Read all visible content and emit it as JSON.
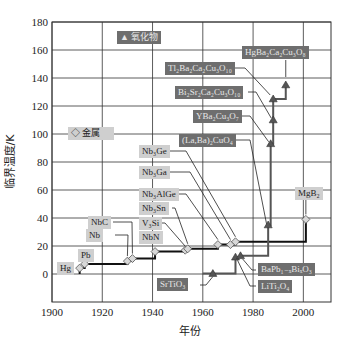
{
  "chart_data": {
    "type": "line",
    "title": "",
    "xlabel": "年份",
    "ylabel": "临界温度/K",
    "xlim": [
      1900,
      2011
    ],
    "ylim": [
      -20,
      180
    ],
    "xticks": [
      1900,
      1920,
      1940,
      1960,
      1980,
      2000
    ],
    "yticks": [
      0,
      20,
      40,
      60,
      80,
      100,
      120,
      140,
      160,
      180
    ],
    "grid": true,
    "legend": [
      {
        "marker": "diamond",
        "label": "金属"
      },
      {
        "marker": "triangle",
        "label": "氧化物"
      }
    ],
    "series": [
      {
        "name": "金属",
        "marker": "diamond",
        "points": [
          {
            "label": "Hg",
            "x": 1911,
            "y": 4.2
          },
          {
            "label": "Pb",
            "x": 1913,
            "y": 7.2
          },
          {
            "label": "Nb",
            "x": 1930,
            "y": 9.2
          },
          {
            "label": "NbC",
            "x": 1932,
            "y": 11
          },
          {
            "label": "NbN",
            "x": 1941,
            "y": 16
          },
          {
            "label": "V3Si",
            "x": 1953,
            "y": 17
          },
          {
            "label": "Nb3Sn",
            "x": 1954,
            "y": 18
          },
          {
            "label": "Nb3AlGe",
            "x": 1966,
            "y": 21
          },
          {
            "label": "Nb3Ga",
            "x": 1971,
            "y": 21
          },
          {
            "label": "Nb3Ge",
            "x": 1973,
            "y": 23
          },
          {
            "label": "MgB2",
            "x": 2001,
            "y": 39
          }
        ]
      },
      {
        "name": "氧化物",
        "marker": "triangle",
        "points": [
          {
            "label": "SrTiO3",
            "x": 1964,
            "y": 0.3
          },
          {
            "label": "LiTi2O4",
            "x": 1973,
            "y": 12
          },
          {
            "label": "BaPb1-xBixO3",
            "x": 1975,
            "y": 13
          },
          {
            "label": "(La,Ba)2CuO4",
            "x": 1986,
            "y": 35
          },
          {
            "label": "YBa2Cu3O7",
            "x": 1987,
            "y": 93
          },
          {
            "label": "Bi2Sr2Ca2Cu3O10",
            "x": 1988,
            "y": 110
          },
          {
            "label": "Tl2Ba2Ca2Cu3O10",
            "x": 1988,
            "y": 125
          },
          {
            "label": "HgBa2Ca2Cu3O8",
            "x": 1993,
            "y": 135
          }
        ]
      }
    ]
  },
  "legend": {
    "metal": "◇ 金属",
    "oxide": "▲ 氧化物"
  },
  "labels": {
    "Hg": "Hg",
    "Pb": "Pb",
    "Nb": "Nb",
    "NbC": "NbC",
    "NbN": "NbN",
    "V3Si": "V₃Si",
    "Nb3Sn": "Nb₃Sn",
    "Nb3AlGe": "Nb₃AlGe",
    "Nb3Ga": "Nb₃Ga",
    "Nb3Ge": "Nb₃Ge",
    "MgB2": "MgB₂",
    "SrTiO3": "SrTiO₃",
    "LiTi2O4": "LiTi₂O₄",
    "BaPbBiO3": "BaPb₁₋ₓBiₓO₃",
    "LaBaCuO4": "(La,Ba)₂CuO₄",
    "YBCO": "YBa₂Cu₃O₇",
    "BSCCO": "Bi₂Sr₂Ca₂Cu₃O₁₀",
    "TBCCO": "Tl₂Ba₂Ca₂Cu₃O₁₀",
    "HBCCO": "HgBa₂Ca₂Cu₃O₈"
  }
}
